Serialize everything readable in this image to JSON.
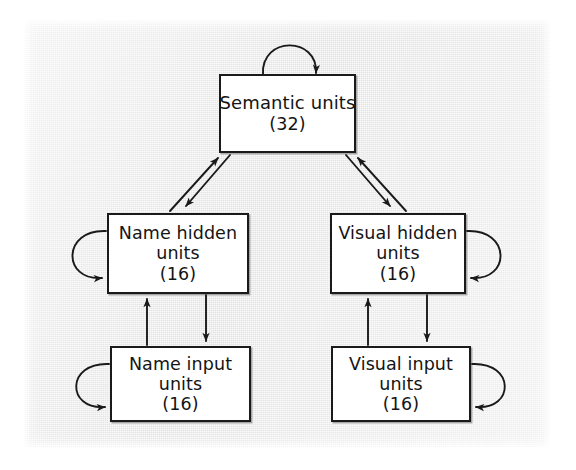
{
  "diagram": {
    "type": "neural-network-architecture",
    "title": "",
    "background_color": "#e8e8e8",
    "box_fill_color": "#ffffff",
    "line_color": "#1a1a1a",
    "nodes": [
      {
        "id": "semantic",
        "label": "Semantic units",
        "count": "(32)",
        "units": 32
      },
      {
        "id": "name_hidden",
        "label": "Name hidden",
        "label2": "units",
        "count": "(16)",
        "units": 16
      },
      {
        "id": "visual_hidden",
        "label": "Visual hidden",
        "label2": "units",
        "count": "(16)",
        "units": 16
      },
      {
        "id": "name_input",
        "label": "Name input",
        "label2": "units",
        "count": "(16)",
        "units": 16
      },
      {
        "id": "visual_input",
        "label": "Visual input",
        "label2": "units",
        "count": "(16)",
        "units": 16
      }
    ],
    "connections": [
      {
        "from": "semantic",
        "to": "semantic",
        "kind": "self-loop",
        "side": "top"
      },
      {
        "from": "name_hidden",
        "to": "name_hidden",
        "kind": "self-loop",
        "side": "left"
      },
      {
        "from": "visual_hidden",
        "to": "visual_hidden",
        "kind": "self-loop",
        "side": "right"
      },
      {
        "from": "name_input",
        "to": "name_input",
        "kind": "self-loop",
        "side": "left"
      },
      {
        "from": "visual_input",
        "to": "visual_input",
        "kind": "self-loop",
        "side": "right"
      },
      {
        "from": "name_hidden",
        "to": "semantic",
        "kind": "arrow",
        "direction": "up-right"
      },
      {
        "from": "semantic",
        "to": "name_hidden",
        "kind": "arrow",
        "direction": "down-left"
      },
      {
        "from": "visual_hidden",
        "to": "semantic",
        "kind": "arrow",
        "direction": "up-left"
      },
      {
        "from": "semantic",
        "to": "visual_hidden",
        "kind": "arrow",
        "direction": "down-right"
      },
      {
        "from": "name_input",
        "to": "name_hidden",
        "kind": "arrow",
        "direction": "up"
      },
      {
        "from": "name_hidden",
        "to": "name_input",
        "kind": "arrow",
        "direction": "down"
      },
      {
        "from": "visual_input",
        "to": "visual_hidden",
        "kind": "arrow",
        "direction": "up"
      },
      {
        "from": "visual_hidden",
        "to": "visual_input",
        "kind": "arrow",
        "direction": "down"
      }
    ]
  }
}
